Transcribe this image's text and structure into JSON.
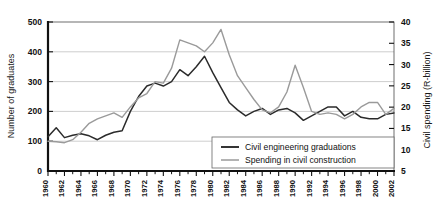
{
  "chart_data": {
    "type": "line",
    "title": "",
    "xlabel": "",
    "ylabel": "Number of graduates",
    "y2label": "Civil spending (R-billion)",
    "grid": true,
    "legend_position": "bottom-right",
    "xlim": [
      1960,
      2002
    ],
    "ylim": [
      0,
      500
    ],
    "y2lim": [
      5,
      40
    ],
    "yticks": [
      0,
      100,
      200,
      300,
      400,
      500
    ],
    "y2ticks": [
      5,
      10,
      15,
      20,
      25,
      30,
      35,
      40
    ],
    "xticks": [
      1960,
      1962,
      1964,
      1966,
      1968,
      1970,
      1972,
      1974,
      1976,
      1978,
      1980,
      1982,
      1984,
      1986,
      1988,
      1990,
      1992,
      1994,
      1996,
      1998,
      2000,
      2002
    ],
    "x": [
      1960,
      1961,
      1962,
      1963,
      1964,
      1965,
      1966,
      1967,
      1968,
      1969,
      1970,
      1971,
      1972,
      1973,
      1974,
      1975,
      1976,
      1977,
      1978,
      1979,
      1980,
      1981,
      1982,
      1983,
      1984,
      1985,
      1986,
      1987,
      1988,
      1989,
      1990,
      1991,
      1992,
      1993,
      1994,
      1995,
      1996,
      1997,
      1998,
      1999,
      2000,
      2001,
      2002
    ],
    "series": [
      {
        "name": "Civil engineering graduations",
        "axis": "left",
        "color": "#2b2b2b",
        "values": [
          115,
          145,
          112,
          120,
          125,
          118,
          105,
          120,
          130,
          135,
          200,
          250,
          285,
          295,
          285,
          300,
          340,
          320,
          350,
          385,
          330,
          280,
          230,
          205,
          185,
          200,
          210,
          190,
          205,
          210,
          195,
          170,
          185,
          200,
          215,
          215,
          185,
          200,
          180,
          175,
          175,
          190,
          195
        ]
      },
      {
        "name": "Spending in civil construction",
        "axis": "right",
        "color": "#9a9a9a",
        "values": [
          100,
          98,
          95,
          105,
          130,
          160,
          175,
          185,
          195,
          180,
          215,
          245,
          260,
          300,
          295,
          345,
          440,
          430,
          420,
          400,
          430,
          475,
          390,
          320,
          280,
          240,
          205,
          195,
          215,
          265,
          355,
          280,
          200,
          190,
          195,
          190,
          175,
          190,
          215,
          230,
          230,
          190,
          210
        ]
      }
    ]
  },
  "axes": {
    "left_title": "Number of graduates",
    "right_title": "Civil spending (R-billion)",
    "left_ticks": [
      "0",
      "100",
      "200",
      "300",
      "400",
      "500"
    ],
    "right_ticks": [
      "5",
      "10",
      "15",
      "20",
      "25",
      "30",
      "35",
      "40"
    ],
    "x_ticks": [
      "1960",
      "1962",
      "1964",
      "1966",
      "1968",
      "1970",
      "1972",
      "1974",
      "1976",
      "1978",
      "1980",
      "1982",
      "1984",
      "1986",
      "1988",
      "1990",
      "1992",
      "1994",
      "1996",
      "1998",
      "2000",
      "2002"
    ]
  },
  "legend": {
    "entries": [
      {
        "label": "Civil engineering graduations",
        "color": "#2b2b2b"
      },
      {
        "label": "Spending in civil construction",
        "color": "#9a9a9a"
      }
    ]
  }
}
